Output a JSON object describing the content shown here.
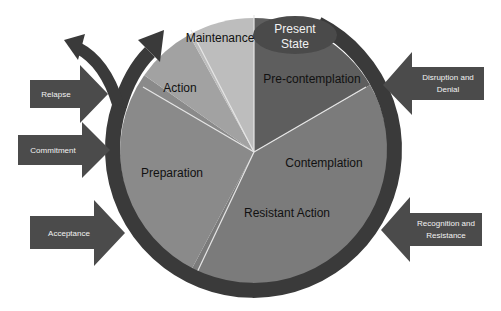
{
  "diagram": {
    "type": "cycle-pie",
    "center": {
      "x": 254,
      "y": 152
    },
    "pie_radius": 134,
    "colors": {
      "ring": "#3a3a3a",
      "arrows": "#4b4b4b",
      "divider": "#e6e6e6",
      "present_state": "#4a4a4a"
    },
    "present_state": {
      "line1": "Present",
      "line2": "State"
    },
    "slices": [
      {
        "label": "Pre-contemplation",
        "start_deg": 0,
        "end_deg": 60,
        "color": "#5e5e5e"
      },
      {
        "label": "Contemplation",
        "start_deg": 60,
        "end_deg": 208,
        "color": "#7b7b7b"
      },
      {
        "label": "Resistant Action",
        "start_deg": 60,
        "end_deg": 208,
        "color": "#7b7b7b"
      },
      {
        "label": "Preparation",
        "start_deg": 208,
        "end_deg": 305,
        "color": "#8a8a8a"
      },
      {
        "label": "Action",
        "start_deg": 305,
        "end_deg": 331,
        "color": "#a2a2a2"
      },
      {
        "label": "Maintenance",
        "start_deg": 331,
        "end_deg": 360,
        "color": "#bdbdbd"
      }
    ],
    "left_arrows": [
      {
        "label": "Relapse"
      },
      {
        "label": "Commitment"
      },
      {
        "label": "Acceptance"
      }
    ],
    "right_arrows": [
      {
        "line1": "Disruption and",
        "line2": "Denial"
      },
      {
        "line1": "Recognition and",
        "line2": "Resistance"
      }
    ]
  }
}
